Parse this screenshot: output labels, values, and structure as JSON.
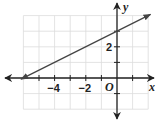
{
  "chart_data": {
    "type": "line",
    "title": "",
    "xlabel": "x",
    "ylabel": "y",
    "origin_label": "O",
    "xlim": [
      -6,
      2
    ],
    "ylim": [
      -2,
      4
    ],
    "grid": true,
    "x_tick_labels": [
      "-4",
      "-2"
    ],
    "y_tick_labels": [
      "2"
    ],
    "series": [
      {
        "name": "line",
        "equation": "y = 0.5x + 3",
        "slope": 0.5,
        "y_intercept": 3,
        "x_intercept": -6,
        "x": [
          -6,
          2
        ],
        "y": [
          0,
          4
        ],
        "arrows_both_ends": true
      }
    ]
  },
  "colors": {
    "grid": "#dcdcdc",
    "axis": "#222222",
    "line": "#444444"
  }
}
